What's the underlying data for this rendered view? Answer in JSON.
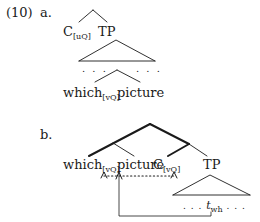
{
  "example": {
    "number": "(10)",
    "part_a": {
      "label": "a.",
      "nodes": {
        "c": {
          "head": "C",
          "feature": "[uQ]"
        },
        "tp": "TP",
        "dots_left": ". . .",
        "dots_right": ". . .",
        "which": {
          "word": "which",
          "feature": "[vQ]"
        },
        "picture": "picture"
      }
    },
    "part_b": {
      "label": "b.",
      "nodes": {
        "which": {
          "word": "which",
          "feature": "[vQ]"
        },
        "picture": "picture",
        "c": {
          "head": "C",
          "feature": "[vQ]"
        },
        "tp": "TP",
        "trace": {
          "pre": ". . . ",
          "t": "t",
          "sub": "wh",
          "post": " . . ."
        }
      }
    }
  },
  "colors": {
    "ink": "#1a1a1a",
    "background": "#ffffff"
  }
}
